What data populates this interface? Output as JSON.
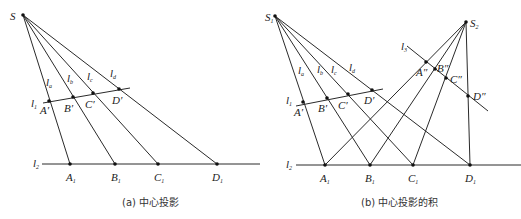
{
  "panels": [
    {
      "id": "a",
      "caption": "(a) 中心投影",
      "labels": {
        "S": "S",
        "la": "l",
        "la_sub": "a",
        "lb": "l",
        "lb_sub": "b",
        "lc": "l",
        "lc_sub": "c",
        "ld": "l",
        "ld_sub": "d",
        "l1": "l",
        "l1_sub": "1",
        "l2": "l",
        "l2_sub": "2",
        "A_prime": "A′",
        "B_prime": "B′",
        "C_prime": "C′",
        "D_prime": "D′",
        "A1": "A",
        "B1": "B",
        "C1": "C",
        "D1": "D",
        "sub1": "1"
      }
    },
    {
      "id": "b",
      "caption": "(b) 中心投影的积",
      "labels": {
        "S1": "S",
        "S1_sub": "1",
        "S2": "S",
        "S2_sub": "2",
        "la": "l",
        "la_sub": "a",
        "lb": "l",
        "lb_sub": "b",
        "lc": "l",
        "lc_sub": "c",
        "ld": "l",
        "ld_sub": "d",
        "l1": "l",
        "l1_sub": "1",
        "l2": "l",
        "l2_sub": "2",
        "l3": "l",
        "l3_sub": "3",
        "A_prime": "A′",
        "B_prime": "B′",
        "C_prime": "C′",
        "D_prime": "D′",
        "A_dprime": "A″",
        "B_dprime": "B″",
        "C_dprime": "C″",
        "D_dprime": "D″",
        "A1": "A",
        "B1": "B",
        "C1": "C",
        "D1": "D",
        "sub1": "1"
      }
    }
  ]
}
